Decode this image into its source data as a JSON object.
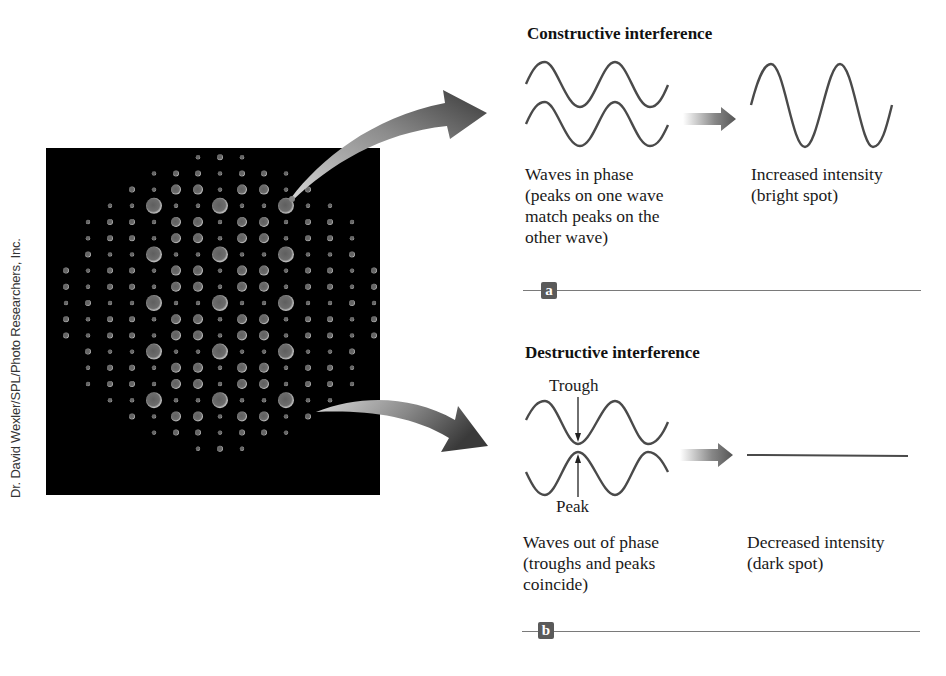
{
  "credit": "Dr. David Wexler/SPL/Photo Researchers, Inc.",
  "photo": {
    "subject": "x-ray-diffraction-pattern",
    "background": "#000000",
    "spot_color": "#a8a8a8"
  },
  "panel_a": {
    "title": "Constructive interference",
    "input_caption": "Waves in phase\n(peaks on one wave\nmatch peaks on the\nother wave)",
    "result_caption": "Increased intensity\n(bright spot)",
    "badge": "a"
  },
  "panel_b": {
    "title": "Destructive interference",
    "trough_label": "Trough",
    "peak_label": "Peak",
    "input_caption": "Waves out of phase\n(troughs and peaks\ncoincide)",
    "result_caption": "Decreased intensity\n(dark spot)",
    "badge": "b"
  },
  "colors": {
    "wave": "#4a4a4a",
    "arrow_dark": "#3c3c3c",
    "arrow_light": "#c8c8c8",
    "rule": "#7a7a7a",
    "badge": "#5a5a5a"
  }
}
